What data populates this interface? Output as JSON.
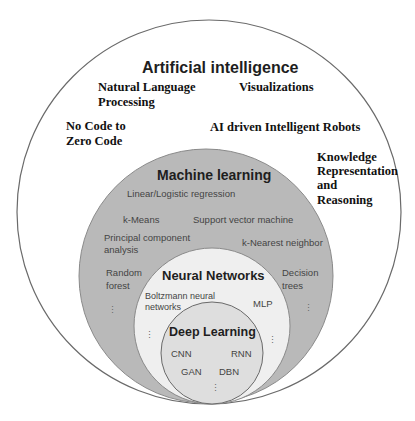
{
  "diagram": {
    "type": "nested-circles",
    "colors": {
      "ai_fill": "#ffffff",
      "ml_fill": "#b9b9b9",
      "nn_fill": "#efefef",
      "dl_fill": "#dedede",
      "stroke": "#6a6a6a"
    },
    "ai": {
      "title": "Artificial intelligence",
      "items": [
        "Natural Language",
        "Processing",
        "Visualizations",
        "No Code to",
        "Zero Code",
        "AI driven Intelligent Robots",
        "Knowledge",
        "Representation",
        "and",
        "Reasoning"
      ]
    },
    "ml": {
      "title": "Machine learning",
      "items": [
        "Linear/Logistic regression",
        "k-Means",
        "Support vector machine",
        "Principal component",
        "analysis",
        "k-Nearest neighbor",
        "Random",
        "forest",
        "Decision",
        "trees"
      ]
    },
    "nn": {
      "title": "Neural Networks",
      "items": [
        "Boltzmann neural",
        "networks",
        "MLP"
      ]
    },
    "dl": {
      "title": "Deep Learning",
      "items": [
        "CNN",
        "RNN",
        "GAN",
        "DBN"
      ]
    },
    "ellipsis": "⋮"
  }
}
